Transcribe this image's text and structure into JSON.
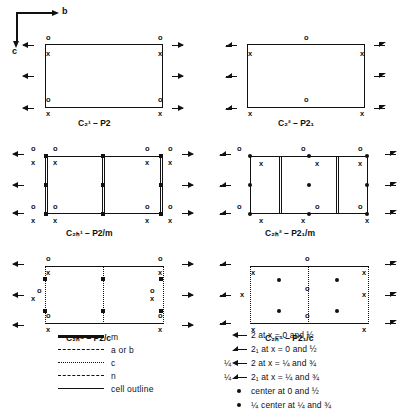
{
  "axes": {
    "b_label": "b",
    "c_label": "c"
  },
  "diagrams": [
    {
      "id": "p2",
      "caption_schoenflies": "C",
      "caption_sup": "1",
      "caption_sub": "2",
      "caption_hm": "– P2",
      "caption_full": "C₂¹ – P2",
      "corner_labels": [
        "o",
        "x",
        "o",
        "x",
        "o",
        "x",
        "o",
        "x"
      ]
    },
    {
      "id": "p21",
      "caption_schoenflies": "C",
      "caption_sup": "2",
      "caption_sub": "2",
      "caption_hm": "– P2₁",
      "caption_full": "C₂² – P2₁",
      "corner_labels": [
        "x",
        "o",
        "x",
        "x",
        "o",
        "x"
      ]
    },
    {
      "id": "p2m",
      "caption_schoenflies": "C",
      "caption_sup": "1",
      "caption_sub": "2h",
      "caption_hm": "– P2/m",
      "caption_full": "C₂ₕ¹ – P2/m",
      "corner_labels": [
        "o",
        "x",
        "o",
        "x",
        "o",
        "x",
        "o",
        "x"
      ]
    },
    {
      "id": "p21m",
      "caption_schoenflies": "C",
      "caption_sup": "2",
      "caption_sub": "2h",
      "caption_hm": "– P2₁/m",
      "caption_full": "C₂ₕ² – P2₁/m",
      "corner_labels": [
        "o",
        "x",
        "o",
        "x",
        "o",
        "x"
      ]
    },
    {
      "id": "p2c",
      "caption_schoenflies": "C",
      "caption_sup": "4",
      "caption_sub": "2h",
      "caption_hm": "– P2/c",
      "caption_full": "C₂ₕ⁴ – P2/c",
      "corner_labels": [
        "o",
        "x",
        "o",
        "x",
        "o",
        "x",
        "o",
        "x"
      ]
    },
    {
      "id": "p21c",
      "caption_schoenflies": "C",
      "caption_sup": "5",
      "caption_sub": "2h",
      "caption_hm": "– P2₁/c",
      "caption_full": "C₂ₕ⁵ – P2₁/c",
      "corner_labels": [
        "x",
        "o",
        "x",
        "x",
        "o",
        "x"
      ]
    }
  ],
  "legend_left": {
    "rows": [
      {
        "style": "m",
        "label": "m"
      },
      {
        "style": "ab",
        "label": "a or b"
      },
      {
        "style": "c",
        "label": "c"
      },
      {
        "style": "n",
        "label": "n"
      },
      {
        "style": "cell",
        "label": "cell outline"
      }
    ]
  },
  "legend_right": {
    "rows": [
      {
        "prefix": "",
        "icon": "full-arrow",
        "label": "2 at x  =  0 and ½"
      },
      {
        "prefix": "",
        "icon": "half-arrow",
        "label": "2₁ at x  =  0 and ½"
      },
      {
        "prefix": "¼",
        "icon": "full-arrow",
        "label": "2 at x  =  ¼ and ¾"
      },
      {
        "prefix": "¼",
        "icon": "half-arrow",
        "label": "2₁ at x  =  ¼ and ¾"
      },
      {
        "prefix": "",
        "icon": "center-dot",
        "label": "center at 0 and ½"
      },
      {
        "prefix": "",
        "icon": "center-dot-quarter",
        "label": "center at ¼ and ¾",
        "sub_prefix": "¼"
      }
    ]
  }
}
